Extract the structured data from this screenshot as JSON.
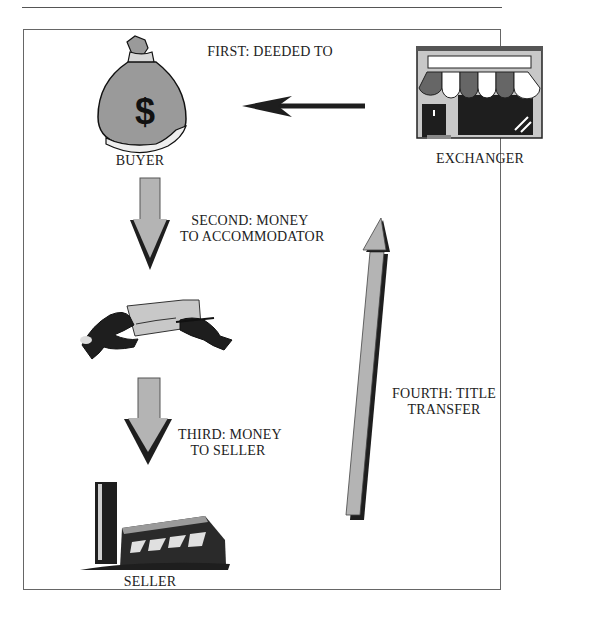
{
  "diagram": {
    "title": "",
    "nodes": [
      {
        "id": "buyer",
        "label": "BUYER",
        "icon": "money-bag-icon"
      },
      {
        "id": "exchanger",
        "label": "EXCHANGER",
        "icon": "storefront-icon"
      },
      {
        "id": "accommodator",
        "label": "",
        "icon": "signing-check-icon"
      },
      {
        "id": "seller",
        "label": "SELLER",
        "icon": "building-icon"
      }
    ],
    "steps": [
      {
        "order": 1,
        "line1": "FIRST: DEEDED TO",
        "line2": "",
        "from": "exchanger",
        "to": "buyer"
      },
      {
        "order": 2,
        "line1": "SECOND:  MONEY",
        "line2": "TO ACCOMMODATOR",
        "from": "buyer",
        "to": "accommodator"
      },
      {
        "order": 3,
        "line1": "THIRD:  MONEY",
        "line2": "TO SELLER",
        "from": "accommodator",
        "to": "seller"
      },
      {
        "order": 4,
        "line1": "FOURTH:  TITLE",
        "line2": "TRANSFER",
        "from": "seller",
        "to": "exchanger"
      }
    ],
    "colors": {
      "arrow_fill": "#b4b4b4",
      "arrow_dark": "#1e1e1e",
      "frame": "#666666"
    }
  }
}
